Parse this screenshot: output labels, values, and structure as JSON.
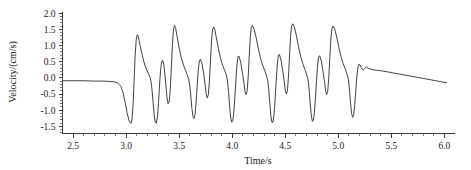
{
  "chart_data": {
    "type": "line",
    "title": "",
    "xlabel": "Time/s",
    "ylabel": "Velocity/(cm/s)",
    "xlim": [
      2.4,
      6.1
    ],
    "ylim": [
      -1.72,
      2.05
    ],
    "grid": false,
    "legend": null,
    "x_ticks": [
      2.5,
      3.0,
      3.5,
      4.0,
      4.5,
      5.0,
      5.5,
      6.0
    ],
    "x_tick_labels": [
      "2.5",
      "3.0",
      "3.5",
      "4.0",
      "4.5",
      "5.0",
      "5.5",
      "6.0"
    ],
    "y_ticks": [
      2.0,
      1.5,
      1.0,
      0.5,
      0.0,
      -0.5,
      -1.0,
      -1.5
    ],
    "y_tick_labels": [
      "2.0",
      "1.5",
      "1.0",
      "0.5",
      "0.0",
      "-0.5",
      "-1.0",
      "-1.5"
    ],
    "x_minor_tick_interval": 0.1,
    "y_minor_tick_interval": 0.1,
    "line_color": "#2b2b2b",
    "series": [
      {
        "name": "velocity",
        "points": [
          [
            2.4,
            -0.09
          ],
          [
            2.5,
            -0.09
          ],
          [
            2.6,
            -0.09
          ],
          [
            2.7,
            -0.1
          ],
          [
            2.78,
            -0.1
          ],
          [
            2.84,
            -0.11
          ],
          [
            2.88,
            -0.12
          ],
          [
            2.92,
            -0.16
          ],
          [
            2.95,
            -0.26
          ],
          [
            2.97,
            -0.45
          ],
          [
            2.99,
            -0.75
          ],
          [
            3.01,
            -1.1
          ],
          [
            3.03,
            -1.35
          ],
          [
            3.045,
            -1.41
          ],
          [
            3.055,
            -1.3
          ],
          [
            3.065,
            -0.85
          ],
          [
            3.075,
            -0.1
          ],
          [
            3.085,
            0.7
          ],
          [
            3.095,
            1.18
          ],
          [
            3.105,
            1.33
          ],
          [
            3.115,
            1.27
          ],
          [
            3.13,
            1.02
          ],
          [
            3.15,
            0.72
          ],
          [
            3.17,
            0.46
          ],
          [
            3.19,
            0.27
          ],
          [
            3.21,
            0.14
          ],
          [
            3.225,
            0.02
          ],
          [
            3.235,
            -0.12
          ],
          [
            3.245,
            -0.4
          ],
          [
            3.255,
            -0.8
          ],
          [
            3.265,
            -1.18
          ],
          [
            3.275,
            -1.37
          ],
          [
            3.285,
            -1.4
          ],
          [
            3.295,
            -1.21
          ],
          [
            3.305,
            -0.76
          ],
          [
            3.315,
            -0.22
          ],
          [
            3.325,
            0.25
          ],
          [
            3.335,
            0.5
          ],
          [
            3.345,
            0.54
          ],
          [
            3.355,
            0.41
          ],
          [
            3.365,
            0.12
          ],
          [
            3.375,
            -0.25
          ],
          [
            3.385,
            -0.6
          ],
          [
            3.395,
            -0.8
          ],
          [
            3.405,
            -0.75
          ],
          [
            3.415,
            -0.4
          ],
          [
            3.425,
            0.25
          ],
          [
            3.435,
            0.95
          ],
          [
            3.445,
            1.45
          ],
          [
            3.455,
            1.62
          ],
          [
            3.465,
            1.56
          ],
          [
            3.48,
            1.28
          ],
          [
            3.5,
            0.92
          ],
          [
            3.52,
            0.62
          ],
          [
            3.54,
            0.4
          ],
          [
            3.56,
            0.23
          ],
          [
            3.575,
            0.1
          ],
          [
            3.59,
            -0.05
          ],
          [
            3.6,
            -0.25
          ],
          [
            3.61,
            -0.58
          ],
          [
            3.62,
            -0.95
          ],
          [
            3.63,
            -1.2
          ],
          [
            3.64,
            -1.26
          ],
          [
            3.65,
            -1.12
          ],
          [
            3.66,
            -0.72
          ],
          [
            3.67,
            -0.22
          ],
          [
            3.68,
            0.25
          ],
          [
            3.69,
            0.52
          ],
          [
            3.7,
            0.57
          ],
          [
            3.715,
            0.44
          ],
          [
            3.73,
            0.14
          ],
          [
            3.745,
            -0.22
          ],
          [
            3.755,
            -0.52
          ],
          [
            3.765,
            -0.62
          ],
          [
            3.775,
            -0.52
          ],
          [
            3.785,
            -0.1
          ],
          [
            3.795,
            0.55
          ],
          [
            3.805,
            1.15
          ],
          [
            3.815,
            1.5
          ],
          [
            3.825,
            1.57
          ],
          [
            3.835,
            1.5
          ],
          [
            3.85,
            1.24
          ],
          [
            3.87,
            0.9
          ],
          [
            3.89,
            0.6
          ],
          [
            3.91,
            0.38
          ],
          [
            3.93,
            0.22
          ],
          [
            3.945,
            0.08
          ],
          [
            3.955,
            -0.1
          ],
          [
            3.965,
            -0.42
          ],
          [
            3.975,
            -0.85
          ],
          [
            3.985,
            -1.22
          ],
          [
            3.995,
            -1.37
          ],
          [
            4.005,
            -1.33
          ],
          [
            4.015,
            -1.05
          ],
          [
            4.025,
            -0.58
          ],
          [
            4.035,
            -0.05
          ],
          [
            4.045,
            0.42
          ],
          [
            4.055,
            0.66
          ],
          [
            4.065,
            0.66
          ],
          [
            4.08,
            0.48
          ],
          [
            4.095,
            0.18
          ],
          [
            4.11,
            -0.15
          ],
          [
            4.12,
            -0.42
          ],
          [
            4.13,
            -0.52
          ],
          [
            4.14,
            -0.42
          ],
          [
            4.15,
            0.0
          ],
          [
            4.16,
            0.65
          ],
          [
            4.17,
            1.25
          ],
          [
            4.18,
            1.56
          ],
          [
            4.19,
            1.62
          ],
          [
            4.205,
            1.52
          ],
          [
            4.225,
            1.25
          ],
          [
            4.245,
            0.92
          ],
          [
            4.265,
            0.62
          ],
          [
            4.285,
            0.4
          ],
          [
            4.305,
            0.24
          ],
          [
            4.32,
            0.1
          ],
          [
            4.335,
            -0.08
          ],
          [
            4.345,
            -0.4
          ],
          [
            4.355,
            -0.82
          ],
          [
            4.365,
            -1.2
          ],
          [
            4.375,
            -1.38
          ],
          [
            4.385,
            -1.36
          ],
          [
            4.395,
            -1.1
          ],
          [
            4.405,
            -0.62
          ],
          [
            4.415,
            -0.08
          ],
          [
            4.425,
            0.42
          ],
          [
            4.435,
            0.7
          ],
          [
            4.445,
            0.72
          ],
          [
            4.46,
            0.55
          ],
          [
            4.475,
            0.24
          ],
          [
            4.49,
            -0.1
          ],
          [
            4.5,
            -0.38
          ],
          [
            4.51,
            -0.5
          ],
          [
            4.52,
            -0.4
          ],
          [
            4.53,
            0.02
          ],
          [
            4.54,
            0.68
          ],
          [
            4.55,
            1.28
          ],
          [
            4.56,
            1.6
          ],
          [
            4.57,
            1.67
          ],
          [
            4.585,
            1.58
          ],
          [
            4.605,
            1.3
          ],
          [
            4.625,
            0.96
          ],
          [
            4.645,
            0.66
          ],
          [
            4.665,
            0.44
          ],
          [
            4.685,
            0.26
          ],
          [
            4.7,
            0.12
          ],
          [
            4.715,
            -0.06
          ],
          [
            4.725,
            -0.38
          ],
          [
            4.735,
            -0.78
          ],
          [
            4.745,
            -1.15
          ],
          [
            4.755,
            -1.34
          ],
          [
            4.765,
            -1.32
          ],
          [
            4.775,
            -1.06
          ],
          [
            4.785,
            -0.6
          ],
          [
            4.795,
            -0.08
          ],
          [
            4.805,
            0.4
          ],
          [
            4.815,
            0.66
          ],
          [
            4.825,
            0.68
          ],
          [
            4.84,
            0.52
          ],
          [
            4.855,
            0.22
          ],
          [
            4.87,
            -0.12
          ],
          [
            4.88,
            -0.4
          ],
          [
            4.89,
            -0.52
          ],
          [
            4.9,
            -0.42
          ],
          [
            4.91,
            0.0
          ],
          [
            4.92,
            0.62
          ],
          [
            4.93,
            1.2
          ],
          [
            4.94,
            1.52
          ],
          [
            4.95,
            1.6
          ],
          [
            4.965,
            1.52
          ],
          [
            4.985,
            1.26
          ],
          [
            5.005,
            0.94
          ],
          [
            5.025,
            0.66
          ],
          [
            5.045,
            0.44
          ],
          [
            5.065,
            0.28
          ],
          [
            5.08,
            0.14
          ],
          [
            5.095,
            -0.04
          ],
          [
            5.105,
            -0.36
          ],
          [
            5.115,
            -0.76
          ],
          [
            5.125,
            -1.1
          ],
          [
            5.135,
            -1.22
          ],
          [
            5.145,
            -1.14
          ],
          [
            5.155,
            -0.82
          ],
          [
            5.165,
            -0.38
          ],
          [
            5.175,
            0.05
          ],
          [
            5.185,
            0.32
          ],
          [
            5.195,
            0.42
          ],
          [
            5.205,
            0.4
          ],
          [
            5.215,
            0.32
          ],
          [
            5.225,
            0.26
          ],
          [
            5.235,
            0.24
          ],
          [
            5.245,
            0.27
          ],
          [
            5.255,
            0.32
          ],
          [
            5.265,
            0.33
          ],
          [
            5.28,
            0.3
          ],
          [
            5.3,
            0.27
          ],
          [
            5.33,
            0.25
          ],
          [
            5.37,
            0.23
          ],
          [
            5.42,
            0.21
          ],
          [
            5.47,
            0.18
          ],
          [
            5.52,
            0.15
          ],
          [
            5.57,
            0.12
          ],
          [
            5.62,
            0.09
          ],
          [
            5.67,
            0.06
          ],
          [
            5.72,
            0.03
          ],
          [
            5.77,
            0.0
          ],
          [
            5.82,
            -0.03
          ],
          [
            5.87,
            -0.06
          ],
          [
            5.92,
            -0.09
          ],
          [
            5.97,
            -0.12
          ],
          [
            6.02,
            -0.15
          ]
        ]
      }
    ]
  }
}
